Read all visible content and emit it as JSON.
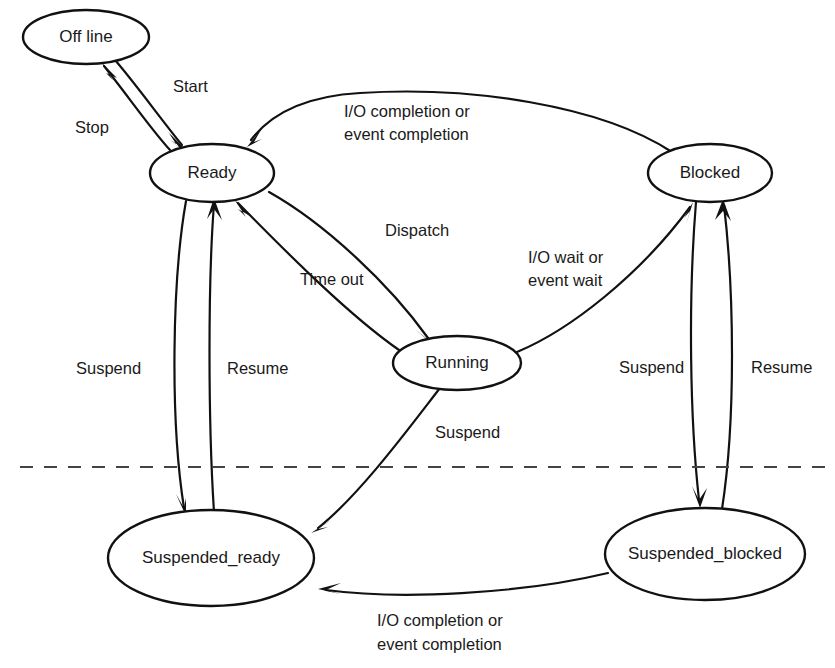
{
  "diagram": {
    "type": "state-transition-diagram",
    "background_color": "#ffffff",
    "stroke_color": "#111111",
    "text_color": "#1a1a1a",
    "divider_color": "#444444",
    "nodes": [
      {
        "id": "offline",
        "label": "Off line",
        "cx": 86,
        "cy": 37,
        "rx": 63,
        "ry": 27
      },
      {
        "id": "ready",
        "label": "Ready",
        "cx": 212,
        "cy": 173,
        "rx": 62,
        "ry": 29
      },
      {
        "id": "blocked",
        "label": "Blocked",
        "cx": 710,
        "cy": 173,
        "rx": 62,
        "ry": 29
      },
      {
        "id": "running",
        "label": "Running",
        "cx": 457,
        "cy": 363,
        "rx": 64,
        "ry": 27
      },
      {
        "id": "suspended_ready",
        "label": "Suspended_ready",
        "cx": 211,
        "cy": 558,
        "rx": 103,
        "ry": 48
      },
      {
        "id": "suspended_blocked",
        "label": "Suspended_blocked",
        "cx": 705,
        "cy": 554,
        "rx": 100,
        "ry": 46
      }
    ],
    "edges": [
      {
        "id": "start",
        "from": "offline",
        "to": "ready",
        "label": "Start"
      },
      {
        "id": "stop",
        "from": "ready",
        "to": "offline",
        "label": "Stop"
      },
      {
        "id": "io-completion-top",
        "from": "blocked",
        "to": "ready",
        "label": "I/O completion or\nevent completion"
      },
      {
        "id": "dispatch",
        "from": "ready",
        "to": "running",
        "label": "Dispatch"
      },
      {
        "id": "time-out",
        "from": "running",
        "to": "ready",
        "label": "Time out"
      },
      {
        "id": "io-wait",
        "from": "running",
        "to": "blocked",
        "label": "I/O wait or\nevent wait"
      },
      {
        "id": "suspend-ready",
        "from": "ready",
        "to": "suspended_ready",
        "label": "Suspend"
      },
      {
        "id": "resume-ready",
        "from": "suspended_ready",
        "to": "ready",
        "label": "Resume"
      },
      {
        "id": "suspend-running",
        "from": "running",
        "to": "suspended_ready",
        "label": "Suspend"
      },
      {
        "id": "suspend-blocked",
        "from": "blocked",
        "to": "suspended_blocked",
        "label": "Suspend"
      },
      {
        "id": "resume-blocked",
        "from": "suspended_blocked",
        "to": "blocked",
        "label": "Resume"
      },
      {
        "id": "io-completion-bottom",
        "from": "suspended_blocked",
        "to": "suspended_ready",
        "label": "I/O completion or\nevent completion"
      }
    ],
    "labels": {
      "start": "Start",
      "stop": "Stop",
      "io_completion_top_line1": "I/O completion or",
      "io_completion_top_line2": "event completion",
      "dispatch": "Dispatch",
      "time_out": "Time out",
      "io_wait_line1": "I/O wait or",
      "io_wait_line2": "event wait",
      "suspend_left": "Suspend",
      "resume_left": "Resume",
      "suspend_middle": "Suspend",
      "suspend_right": "Suspend",
      "resume_right": "Resume",
      "io_completion_bottom_line1": "I/O completion or",
      "io_completion_bottom_line2": "event completion"
    },
    "node_labels": {
      "offline": "Off line",
      "ready": "Ready",
      "blocked": "Blocked",
      "running": "Running",
      "suspended_ready": "Suspended_ready",
      "suspended_blocked": "Suspended_blocked"
    },
    "divider": {
      "name": "active-suspended-divider",
      "style": "dashed",
      "y": 467,
      "x_start": 20,
      "x_end": 826
    }
  }
}
